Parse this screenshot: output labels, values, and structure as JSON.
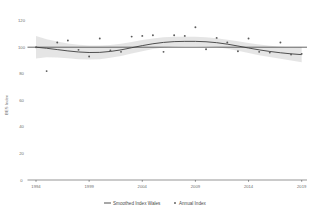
{
  "chart_data": {
    "type": "scatter",
    "title": "",
    "xlabel": "",
    "ylabel": "BES Index",
    "xlim": [
      1993.2,
      2019.5
    ],
    "ylim": [
      0,
      125
    ],
    "grid": false,
    "legend_position": "bottom",
    "x_ticks": [
      "1994",
      "1999",
      "2004",
      "2009",
      "2014",
      "2019"
    ],
    "y_ticks": [
      "0",
      "20",
      "40",
      "60",
      "80",
      "100",
      "120"
    ],
    "reference_line": {
      "label": "100",
      "value": 100
    },
    "series": [
      {
        "name": "Smoothed Index Wales",
        "type": "line",
        "x": [
          1994,
          1995,
          1996,
          1997,
          1998,
          1999,
          2000,
          2001,
          2002,
          2003,
          2004,
          2005,
          2006,
          2007,
          2008,
          2009,
          2010,
          2011,
          2012,
          2013,
          2014,
          2015,
          2016,
          2017,
          2018,
          2019
        ],
        "values": [
          100.0,
          99.2,
          98.2,
          97.2,
          96.4,
          96.0,
          96.1,
          96.8,
          98.0,
          99.6,
          101.2,
          102.6,
          103.6,
          104.2,
          104.4,
          104.4,
          104.1,
          103.4,
          102.3,
          100.9,
          99.4,
          98.0,
          96.8,
          95.8,
          95.0,
          94.4
        ]
      },
      {
        "name": "Smoothed Index Wales (upper CI)",
        "type": "band-upper",
        "x": [
          1994,
          1995,
          1996,
          1997,
          1998,
          1999,
          2000,
          2001,
          2002,
          2003,
          2004,
          2005,
          2006,
          2007,
          2008,
          2009,
          2010,
          2011,
          2012,
          2013,
          2014,
          2015,
          2016,
          2017,
          2018,
          2019
        ],
        "values": [
          108.5,
          106.0,
          104.2,
          102.8,
          101.8,
          101.3,
          101.2,
          101.6,
          102.6,
          104.0,
          105.4,
          106.6,
          107.4,
          107.8,
          107.9,
          107.8,
          107.4,
          106.7,
          105.7,
          104.5,
          103.2,
          102.0,
          101.0,
          100.3,
          100.0,
          100.2
        ]
      },
      {
        "name": "Smoothed Index Wales (lower CI)",
        "type": "band-lower",
        "x": [
          1994,
          1995,
          1996,
          1997,
          1998,
          1999,
          2000,
          2001,
          2002,
          2003,
          2004,
          2005,
          2006,
          2007,
          2008,
          2009,
          2010,
          2011,
          2012,
          2013,
          2014,
          2015,
          2016,
          2017,
          2018,
          2019
        ],
        "values": [
          91.5,
          92.4,
          92.2,
          91.6,
          91.0,
          90.7,
          91.0,
          92.0,
          93.4,
          95.2,
          97.0,
          98.6,
          99.8,
          100.6,
          100.9,
          100.9,
          100.7,
          100.1,
          98.9,
          97.3,
          95.6,
          94.0,
          92.6,
          91.3,
          90.0,
          88.6
        ]
      },
      {
        "name": "Annual Index",
        "type": "scatter",
        "x": [
          1994,
          1995,
          1996,
          1997,
          1998,
          1999,
          2000,
          2001,
          2002,
          2003,
          2004,
          2005,
          2006,
          2007,
          2008,
          2009,
          2010,
          2011,
          2012,
          2013,
          2014,
          2015,
          2016,
          2017,
          2018,
          2019
        ],
        "values": [
          100.0,
          82.0,
          103.5,
          105.0,
          98.0,
          93.0,
          106.5,
          97.5,
          96.5,
          108.0,
          108.5,
          109.0,
          96.5,
          109.0,
          108.5,
          115.0,
          98.5,
          107.0,
          103.5,
          97.0,
          106.5,
          96.5,
          96.0,
          103.5,
          94.5,
          95.0
        ]
      }
    ],
    "legend": [
      {
        "label": "Smoothed Index Wales",
        "marker": "line",
        "color": "#3d3d3d"
      },
      {
        "label": "Annual Index",
        "marker": "point",
        "color": "#5a5a5a"
      }
    ],
    "colors": {
      "line": "#3d3d3d",
      "ribbon": "#cfcfcf",
      "point": "#5a5a5a",
      "axis": "#4d4d4d",
      "text": "#6e6e6e"
    }
  }
}
